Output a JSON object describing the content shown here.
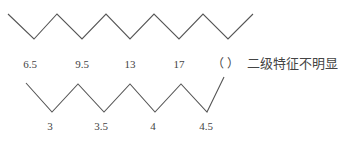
{
  "title": "",
  "top_sequence": {
    "labels": [
      "6.5",
      "9.5",
      "13",
      "17"
    ],
    "blank": "（  ）",
    "note": "二级特征不明显"
  },
  "bottom_sequence": {
    "labels": [
      "3",
      "3.5",
      "4",
      "4.5"
    ]
  },
  "style": {
    "line_color": "#555555",
    "text_color": "#444444",
    "background": "#ffffff"
  }
}
